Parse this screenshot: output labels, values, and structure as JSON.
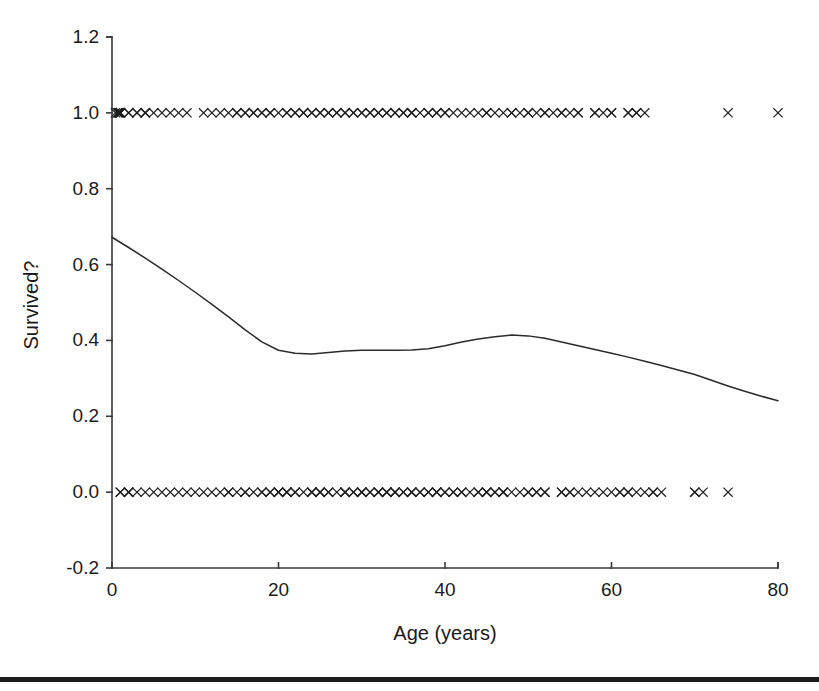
{
  "figure": {
    "background_color": "#ffffff",
    "ink_color": "#1a1a1a",
    "bottom_rule_color": "#1c1c1c"
  },
  "chart_data": {
    "type": "scatter",
    "title": "",
    "subtitle": "",
    "xlabel": "Age (years)",
    "ylabel": "Survived?",
    "xlim": [
      0,
      80
    ],
    "ylim": [
      -0.2,
      1.2
    ],
    "xticks": [
      0,
      20,
      40,
      60,
      80
    ],
    "xtick_labels": [
      "0",
      "20",
      "40",
      "60",
      "80"
    ],
    "yticks": [
      -0.2,
      0.0,
      0.2,
      0.4,
      0.6,
      0.8,
      1.0,
      1.2
    ],
    "ytick_labels": [
      "-0.2",
      "0.0",
      "0.2",
      "0.4",
      "0.6",
      "0.8",
      "1.0",
      "1.2"
    ],
    "grid": false,
    "legend": null,
    "legend_position": "none",
    "annotations": [],
    "marker_symbol": "x",
    "series": [
      {
        "name": "Survived = 1 (observations)",
        "type": "scatter",
        "y_value": 1.0,
        "marker": "x",
        "x": [
          0.42,
          0.67,
          0.75,
          0.83,
          0.92,
          1.0,
          1.0,
          1.0,
          1.0,
          1.0,
          2.0,
          2.0,
          3.0,
          3.0,
          4.0,
          4.0,
          4.0,
          5.0,
          6.0,
          7.0,
          8.0,
          9.0,
          11.0,
          12.0,
          13.0,
          14.0,
          15.0,
          15.0,
          16.0,
          16.0,
          17.0,
          17.0,
          18.0,
          18.0,
          19.0,
          19.0,
          20.0,
          21.0,
          21.0,
          22.0,
          22.0,
          23.0,
          23.0,
          24.0,
          24.0,
          25.0,
          25.0,
          26.0,
          26.0,
          27.0,
          27.0,
          28.0,
          28.0,
          29.0,
          29.0,
          30.0,
          30.0,
          31.0,
          31.0,
          32.0,
          32.0,
          33.0,
          33.0,
          34.0,
          34.0,
          35.0,
          35.0,
          36.0,
          36.0,
          36.0,
          37.0,
          38.0,
          38.0,
          39.0,
          39.0,
          40.0,
          40.0,
          41.0,
          42.0,
          43.0,
          44.0,
          45.0,
          45.0,
          46.0,
          47.0,
          48.0,
          48.0,
          49.0,
          50.0,
          50.0,
          51.0,
          52.0,
          52.0,
          53.0,
          54.0,
          54.0,
          55.0,
          56.0,
          56.0,
          58.0,
          58.0,
          59.0,
          60.0,
          60.0,
          62.0,
          62.0,
          63.0,
          63.0,
          64.0,
          74.0,
          80.0
        ]
      },
      {
        "name": "Survived = 0 (observations)",
        "type": "scatter",
        "y_value": 0.0,
        "marker": "x",
        "x": [
          1.0,
          1.0,
          2.0,
          2.0,
          2.0,
          3.0,
          4.0,
          5.0,
          6.0,
          7.0,
          8.0,
          9.0,
          10.0,
          11.0,
          12.0,
          13.0,
          14.0,
          14.0,
          15.0,
          16.0,
          16.0,
          17.0,
          18.0,
          18.0,
          19.0,
          19.0,
          20.0,
          20.0,
          20.0,
          21.0,
          21.0,
          21.0,
          22.0,
          22.0,
          23.0,
          24.0,
          24.0,
          24.0,
          25.0,
          25.0,
          25.0,
          26.0,
          26.0,
          27.0,
          28.0,
          28.0,
          28.0,
          29.0,
          29.0,
          30.0,
          30.0,
          30.0,
          31.0,
          31.0,
          32.0,
          32.0,
          32.0,
          33.0,
          33.0,
          33.0,
          34.0,
          34.0,
          34.0,
          35.0,
          35.0,
          36.0,
          36.0,
          36.0,
          37.0,
          37.0,
          38.0,
          38.0,
          39.0,
          39.0,
          39.0,
          40.0,
          40.0,
          41.0,
          41.0,
          42.0,
          42.0,
          43.0,
          44.0,
          44.0,
          45.0,
          45.0,
          45.0,
          46.0,
          46.0,
          47.0,
          47.0,
          47.0,
          48.0,
          49.0,
          50.0,
          50.0,
          51.0,
          51.0,
          52.0,
          52.0,
          54.0,
          54.0,
          55.0,
          55.0,
          56.0,
          57.0,
          58.0,
          59.0,
          60.0,
          61.0,
          61.0,
          62.0,
          62.0,
          63.0,
          64.0,
          65.0,
          65.0,
          66.0,
          70.0,
          70.0,
          71.0,
          74.0
        ]
      },
      {
        "name": "Smoothed proportion survived (lowess fit)",
        "type": "line",
        "x": [
          0,
          2,
          4,
          6,
          8,
          10,
          12,
          14,
          16,
          18,
          20,
          22,
          24,
          26,
          28,
          30,
          32,
          34,
          36,
          38,
          40,
          42,
          44,
          46,
          48,
          50,
          52,
          54,
          56,
          58,
          60,
          62,
          64,
          66,
          68,
          70,
          72,
          74,
          76,
          78,
          80
        ],
        "y": [
          0.672,
          0.645,
          0.617,
          0.588,
          0.558,
          0.527,
          0.495,
          0.462,
          0.428,
          0.396,
          0.374,
          0.366,
          0.364,
          0.368,
          0.372,
          0.374,
          0.374,
          0.374,
          0.375,
          0.378,
          0.386,
          0.396,
          0.404,
          0.41,
          0.414,
          0.412,
          0.406,
          0.396,
          0.386,
          0.376,
          0.366,
          0.356,
          0.345,
          0.334,
          0.322,
          0.31,
          0.295,
          0.28,
          0.266,
          0.253,
          0.241
        ]
      }
    ]
  }
}
